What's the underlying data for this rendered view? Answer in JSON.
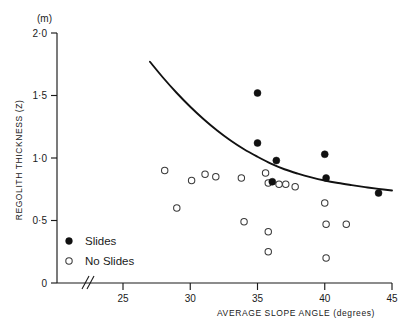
{
  "chart_data": {
    "type": "scatter",
    "title": "",
    "xlabel": "AVERAGE SLOPE ANGLE (degrees)",
    "ylabel": "REGOLITH  THICKNESS  (Z)",
    "yunit": "(m)",
    "xlim": [
      23.5,
      45.5
    ],
    "ylim": [
      0,
      2.0
    ],
    "xticks": [
      25,
      30,
      35,
      40,
      45
    ],
    "xtick_labels": [
      "25",
      "30",
      "35",
      "40",
      "45"
    ],
    "yticks": [
      0,
      0.5,
      1.0,
      1.5,
      2.0
    ],
    "ytick_labels": [
      "0",
      "0·5",
      "1·0",
      "1·5",
      "2·0"
    ],
    "grid": false,
    "axis_break": true,
    "legend_position": "lower-left",
    "series": [
      {
        "name": "Slides",
        "marker": "filled-circle",
        "color": "#111111",
        "points": [
          {
            "x": 35.0,
            "y": 1.52
          },
          {
            "x": 35.0,
            "y": 1.12
          },
          {
            "x": 36.4,
            "y": 0.98
          },
          {
            "x": 36.1,
            "y": 0.81
          },
          {
            "x": 40.0,
            "y": 1.03
          },
          {
            "x": 40.1,
            "y": 0.84
          },
          {
            "x": 44.0,
            "y": 0.72
          }
        ]
      },
      {
        "name": "No Slides",
        "marker": "open-circle",
        "color": "#3a3a3a",
        "points": [
          {
            "x": 28.1,
            "y": 0.9
          },
          {
            "x": 29.0,
            "y": 0.6
          },
          {
            "x": 30.1,
            "y": 0.82
          },
          {
            "x": 31.1,
            "y": 0.87
          },
          {
            "x": 31.9,
            "y": 0.85
          },
          {
            "x": 33.8,
            "y": 0.84
          },
          {
            "x": 34.0,
            "y": 0.49
          },
          {
            "x": 35.6,
            "y": 0.88
          },
          {
            "x": 35.8,
            "y": 0.8
          },
          {
            "x": 36.6,
            "y": 0.79
          },
          {
            "x": 37.1,
            "y": 0.79
          },
          {
            "x": 37.8,
            "y": 0.77
          },
          {
            "x": 35.8,
            "y": 0.41
          },
          {
            "x": 35.8,
            "y": 0.25
          },
          {
            "x": 40.0,
            "y": 0.64
          },
          {
            "x": 40.1,
            "y": 0.47
          },
          {
            "x": 41.6,
            "y": 0.47
          },
          {
            "x": 40.1,
            "y": 0.2
          }
        ]
      }
    ],
    "trend_curve": {
      "name": "fitted-decay-curve",
      "points": [
        {
          "x": 27.0,
          "y": 1.77
        },
        {
          "x": 28.0,
          "y": 1.64
        },
        {
          "x": 29.0,
          "y": 1.52
        },
        {
          "x": 30.0,
          "y": 1.41
        },
        {
          "x": 31.0,
          "y": 1.31
        },
        {
          "x": 32.0,
          "y": 1.22
        },
        {
          "x": 33.0,
          "y": 1.14
        },
        {
          "x": 34.0,
          "y": 1.07
        },
        {
          "x": 35.0,
          "y": 1.01
        },
        {
          "x": 36.0,
          "y": 0.955
        },
        {
          "x": 37.0,
          "y": 0.91
        },
        {
          "x": 38.0,
          "y": 0.875
        },
        {
          "x": 39.0,
          "y": 0.845
        },
        {
          "x": 40.0,
          "y": 0.82
        },
        {
          "x": 41.0,
          "y": 0.8
        },
        {
          "x": 42.0,
          "y": 0.783
        },
        {
          "x": 43.0,
          "y": 0.767
        },
        {
          "x": 44.0,
          "y": 0.753
        },
        {
          "x": 45.0,
          "y": 0.74
        }
      ]
    }
  },
  "legend": {
    "entries": [
      {
        "label": "Slides",
        "marker": "filled-circle"
      },
      {
        "label": "No Slides",
        "marker": "open-circle"
      }
    ]
  }
}
